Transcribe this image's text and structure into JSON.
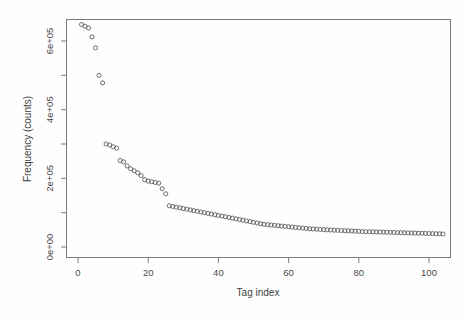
{
  "chart_data": {
    "type": "scatter",
    "title": "",
    "xlabel": "Tag index",
    "ylabel": "Frequency (counts)",
    "xlim": [
      0,
      105
    ],
    "ylim": [
      0,
      660000
    ],
    "grid": false,
    "legend": null,
    "marker": "open-circle",
    "xticks": [
      0,
      20,
      40,
      60,
      80,
      100
    ],
    "xticklabels": [
      "0",
      "20",
      "40",
      "60",
      "80",
      "100"
    ],
    "yticks": [
      0,
      100000,
      200000,
      300000,
      400000,
      500000,
      600000
    ],
    "yticklabels": [
      "0e+00",
      "",
      "2e+05",
      "",
      "4e+05",
      "",
      "6e+05"
    ],
    "ylabeled_ticks": [
      {
        "value": 0,
        "label": "0e+00"
      },
      {
        "value": 200000,
        "label": "2e+05"
      },
      {
        "value": 400000,
        "label": "4e+05"
      },
      {
        "value": 600000,
        "label": "6e+05"
      }
    ],
    "x": [
      1,
      2,
      3,
      4,
      5,
      6,
      7,
      8,
      9,
      10,
      11,
      12,
      13,
      14,
      15,
      16,
      17,
      18,
      19,
      20,
      21,
      22,
      23,
      24,
      25,
      26,
      27,
      28,
      29,
      30,
      31,
      32,
      33,
      34,
      35,
      36,
      37,
      38,
      39,
      40,
      41,
      42,
      43,
      44,
      45,
      46,
      47,
      48,
      49,
      50,
      51,
      52,
      53,
      54,
      55,
      56,
      57,
      58,
      59,
      60,
      61,
      62,
      63,
      64,
      65,
      66,
      67,
      68,
      69,
      70,
      71,
      72,
      73,
      74,
      75,
      76,
      77,
      78,
      79,
      80,
      81,
      82,
      83,
      84,
      85,
      86,
      87,
      88,
      89,
      90,
      91,
      92,
      93,
      94,
      95,
      96,
      97,
      98,
      99,
      100,
      101,
      102,
      103,
      104
    ],
    "y": [
      648000,
      643000,
      638000,
      612000,
      580000,
      500000,
      478000,
      300000,
      297000,
      292000,
      288000,
      252000,
      248000,
      236000,
      228000,
      222000,
      216000,
      208000,
      196000,
      192000,
      190000,
      188000,
      186000,
      170000,
      155000,
      120000,
      118000,
      116000,
      114000,
      112000,
      110000,
      108000,
      106000,
      104000,
      102000,
      100000,
      98000,
      96000,
      94000,
      92000,
      90000,
      88000,
      86000,
      84000,
      82000,
      80000,
      78000,
      76000,
      74000,
      72000,
      70000,
      68000,
      66000,
      65000,
      64000,
      63000,
      62000,
      61000,
      60000,
      59000,
      58000,
      57000,
      56000,
      55000,
      54000,
      53000,
      52500,
      52000,
      51000,
      50500,
      50000,
      49500,
      49000,
      48500,
      48000,
      47500,
      47000,
      46500,
      46000,
      45500,
      45000,
      44700,
      44400,
      44100,
      43800,
      43500,
      43200,
      42900,
      42600,
      42300,
      42000,
      41700,
      41400,
      41100,
      40800,
      40500,
      40200,
      39900,
      39600,
      39300,
      39000,
      38700,
      38400,
      38000
    ],
    "series_name": "tag-frequency",
    "n_points": 104
  },
  "axes": {
    "y_axis_title": "Frequency (counts)",
    "x_axis_title": "Tag index"
  }
}
